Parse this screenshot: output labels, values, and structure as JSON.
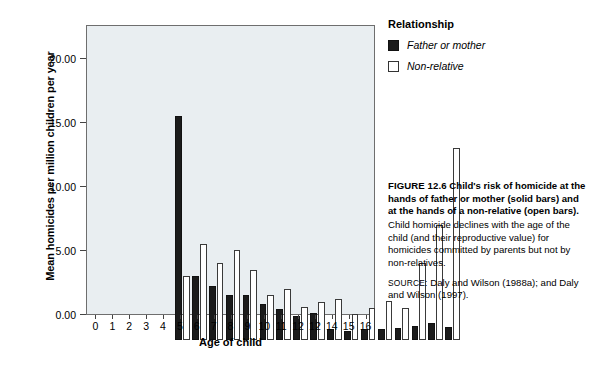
{
  "chart_data": {
    "type": "bar",
    "title": "",
    "xlabel": "Age of child",
    "ylabel": "Mean homicides per million children per year",
    "categories": [
      "0",
      "1",
      "2",
      "3",
      "4",
      "5",
      "6",
      "7",
      "8",
      "9",
      "10",
      "11",
      "12",
      "12",
      "14",
      "15",
      "16"
    ],
    "ylim": [
      0,
      22.5
    ],
    "yticks": [
      "0.00",
      "5.00",
      "10.00",
      "15.00",
      "20.00"
    ],
    "ytick_values": [
      0,
      5,
      10,
      15,
      20
    ],
    "grid": false,
    "legend_position": "outside-top-right",
    "series": [
      {
        "name": "Father or mother",
        "style": "solid",
        "color": "#1b1b1b",
        "values": [
          17.5,
          5.0,
          4.25,
          3.5,
          3.5,
          2.8,
          2.4,
          1.9,
          2.1,
          0.85,
          0.7,
          0.85,
          0.85,
          0.95,
          1.1,
          1.3,
          1.05
        ]
      },
      {
        "name": "Non-relative",
        "style": "open",
        "color": "#ffffff",
        "values": [
          5.0,
          7.5,
          6.0,
          7.0,
          5.45,
          3.5,
          4.0,
          2.6,
          3.0,
          3.2,
          2.05,
          2.5,
          3.05,
          2.5,
          6.0,
          9.0,
          15.0
        ]
      }
    ]
  },
  "legend": {
    "title": "Relationship",
    "items": [
      {
        "label": "Father or mother",
        "swatch": "solid-square-icon"
      },
      {
        "label": "Non-relative",
        "swatch": "open-square-icon"
      }
    ]
  },
  "caption": {
    "figure_number": "FIGURE 12.6",
    "headline": "Child's risk of homicide at the hands of father or mother (solid bars) and at the hands of a non-relative (open bars).",
    "body": "Child homicide declines with the age of the child (and their reproductive value) for homicides committed by parents but not by non-relatives.",
    "source_label": "SOURCE:",
    "source_text": "Daly and Wilson (1988a); and Daly and Wilson (1997)."
  },
  "colors": {
    "plot_background": "#e9eef1",
    "solid_bar": "#1b1b1b",
    "open_bar_fill": "#ffffff",
    "open_bar_stroke": "#3a3a3a",
    "axis": "#6e6e6e",
    "text": "#000000"
  }
}
